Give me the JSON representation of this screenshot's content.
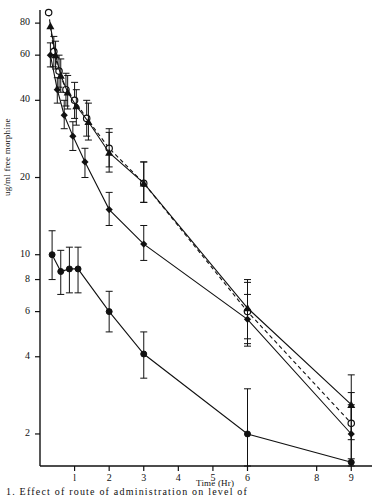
{
  "chart_data": {
    "type": "line",
    "title": "",
    "xlabel": "Time (Hr)",
    "ylabel": "ug/ml free morphine",
    "xlim": [
      0,
      9.6
    ],
    "ylim": [
      1.5,
      90
    ],
    "yscale": "log",
    "grid": false,
    "legend": null,
    "xticks": [
      1,
      2,
      3,
      4,
      5,
      6,
      8,
      9
    ],
    "xtick_labels": [
      "l",
      "2",
      "3",
      "4",
      "5",
      "6",
      "8",
      "9"
    ],
    "yticks": [
      2,
      4,
      6,
      8,
      10,
      20,
      40,
      60,
      80
    ],
    "ytick_labels": [
      "2",
      "4",
      "6",
      "8",
      "10",
      "20",
      "40",
      "60",
      "80"
    ],
    "series": [
      {
        "name": "open-circle-series",
        "marker": "open-circle",
        "linestyle": "dashed",
        "x": [
          0.25,
          0.4,
          0.55,
          0.75,
          1.0,
          1.35,
          2.0,
          3.0,
          6.0,
          9.0
        ],
        "y": [
          88.0,
          62.0,
          52.0,
          44.0,
          40.0,
          34.0,
          26.0,
          19.0,
          6.0,
          2.2
        ],
        "y_err_low": [
          0,
          8,
          7,
          6,
          6,
          5,
          4,
          3,
          1.5,
          0.6
        ],
        "y_err_high": [
          0,
          9,
          8,
          7,
          7,
          6,
          5,
          4,
          1.8,
          0.7
        ]
      },
      {
        "name": "filled-triangle-series",
        "marker": "filled-triangle",
        "linestyle": "solid",
        "x": [
          0.3,
          0.45,
          0.6,
          0.8,
          1.05,
          1.4,
          2.0,
          3.0,
          6.0,
          9.0
        ],
        "y": [
          78.0,
          60.0,
          50.0,
          43.0,
          38.0,
          33.0,
          25.0,
          19.0,
          6.2,
          2.6
        ],
        "y_err_low": [
          0,
          7,
          7,
          6,
          6,
          5,
          4,
          3,
          1.5,
          0.7
        ],
        "y_err_high": [
          0,
          8,
          8,
          7,
          6,
          6,
          5,
          4,
          1.8,
          0.8
        ]
      },
      {
        "name": "filled-diamond-series",
        "marker": "filled-diamond",
        "linestyle": "solid",
        "x": [
          0.3,
          0.5,
          0.7,
          0.95,
          1.3,
          2.0,
          3.0,
          6.0,
          9.0
        ],
        "y": [
          60.0,
          44.0,
          35.0,
          29.0,
          23.0,
          15.0,
          11.0,
          5.6,
          2.0
        ],
        "y_err_low": [
          6,
          5,
          4,
          3.5,
          3,
          2,
          1.5,
          1.2,
          0.5
        ],
        "y_err_high": [
          7,
          5,
          5,
          4,
          3,
          2.5,
          2,
          1.4,
          0.6
        ]
      },
      {
        "name": "filled-circle-series",
        "marker": "filled-circle",
        "linestyle": "solid",
        "x": [
          0.35,
          0.6,
          0.85,
          1.1,
          2.0,
          3.0,
          6.0,
          9.0
        ],
        "y": [
          10.0,
          8.6,
          8.8,
          8.8,
          6.0,
          4.1,
          2.0,
          1.55
        ],
        "y_err_low": [
          2.0,
          1.6,
          1.7,
          1.7,
          1.0,
          0.8,
          0.8,
          0.0
        ],
        "y_err_high": [
          2.4,
          1.8,
          1.9,
          1.9,
          1.2,
          0.9,
          1.0,
          0.0
        ]
      }
    ]
  },
  "caption": {
    "text": "1.   Effect  of  route  of  administration  on  level  of"
  }
}
